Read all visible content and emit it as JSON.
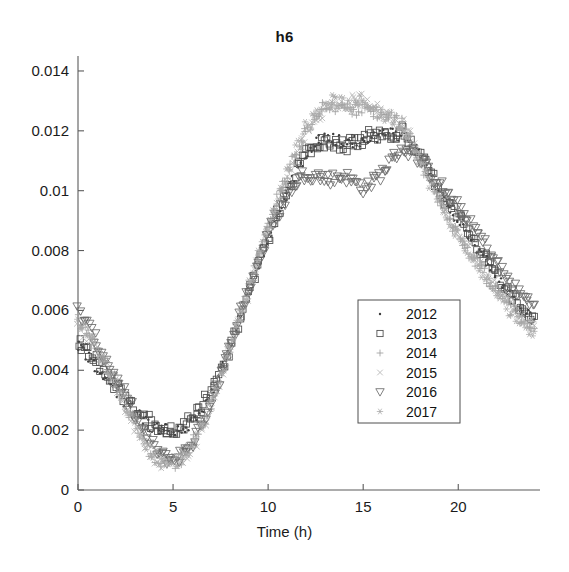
{
  "chart_data": {
    "type": "scatter",
    "title": "h6",
    "xlabel": "Time (h)",
    "ylabel": "",
    "xlim": [
      0,
      24.3
    ],
    "ylim": [
      0,
      0.0145
    ],
    "xticks": [
      0,
      5,
      10,
      15,
      20
    ],
    "xtick_labels": [
      "0",
      "5",
      "10",
      "15",
      "20"
    ],
    "yticks": [
      0,
      0.002,
      0.004,
      0.006,
      0.008,
      0.01,
      0.012,
      0.014
    ],
    "ytick_labels": [
      "0",
      "0.002",
      "0.004",
      "0.006",
      "0.008",
      "0.01",
      "0.012",
      "0.014"
    ],
    "grid": false,
    "legend_position": "center-right",
    "marker_colors": {
      "2012": "#3c3c3c",
      "2013": "#4a4a4a",
      "2014": "#9a9a9a",
      "2015": "#b0b0b0",
      "2016": "#6a6a6a",
      "2017": "#a8a8a8"
    },
    "series": [
      {
        "name": "2012",
        "marker": "point",
        "x": [
          0,
          0.5,
          1,
          1.5,
          2,
          2.5,
          3,
          3.5,
          4,
          4.5,
          5,
          5.5,
          6,
          6.5,
          7,
          7.5,
          8,
          8.5,
          9,
          9.5,
          10,
          10.5,
          11,
          11.5,
          12,
          12.5,
          13,
          13.5,
          14,
          14.5,
          15,
          15.5,
          16,
          16.5,
          17,
          17.5,
          18,
          18.5,
          19,
          19.5,
          20,
          20.5,
          21,
          21.5,
          22,
          22.5,
          23,
          23.5,
          24
        ],
        "values": [
          0.0049,
          0.0045,
          0.0041,
          0.0037,
          0.0033,
          0.0029,
          0.0026,
          0.0023,
          0.0021,
          0.002,
          0.002,
          0.0021,
          0.0023,
          0.0027,
          0.0032,
          0.0039,
          0.0047,
          0.0056,
          0.0065,
          0.0074,
          0.0083,
          0.0091,
          0.0099,
          0.0106,
          0.0112,
          0.0116,
          0.0118,
          0.0117,
          0.0116,
          0.0116,
          0.0117,
          0.0118,
          0.0118,
          0.0119,
          0.0119,
          0.0116,
          0.0111,
          0.0105,
          0.0099,
          0.0094,
          0.009,
          0.0086,
          0.0081,
          0.0076,
          0.0071,
          0.0066,
          0.0062,
          0.0059,
          0.0057
        ]
      },
      {
        "name": "2013",
        "marker": "square",
        "x": [
          0,
          0.5,
          1,
          1.5,
          2,
          2.5,
          3,
          3.5,
          4,
          4.5,
          5,
          5.5,
          6,
          6.5,
          7,
          7.5,
          8,
          8.5,
          9,
          9.5,
          10,
          10.5,
          11,
          11.5,
          12,
          12.5,
          13,
          13.5,
          14,
          14.5,
          15,
          15.5,
          16,
          16.5,
          17,
          17.5,
          18,
          18.5,
          19,
          19.5,
          20,
          20.5,
          21,
          21.5,
          22,
          22.5,
          23,
          23.5,
          24
        ],
        "values": [
          0.005,
          0.0047,
          0.0043,
          0.0039,
          0.0035,
          0.0031,
          0.0027,
          0.0024,
          0.0022,
          0.002,
          0.002,
          0.0021,
          0.0024,
          0.0028,
          0.0033,
          0.004,
          0.0048,
          0.0057,
          0.0066,
          0.0075,
          0.0084,
          0.0092,
          0.01,
          0.0107,
          0.0112,
          0.0115,
          0.0116,
          0.0115,
          0.0115,
          0.0116,
          0.0117,
          0.0119,
          0.0119,
          0.0119,
          0.012,
          0.0117,
          0.0112,
          0.0106,
          0.01,
          0.0095,
          0.0091,
          0.0087,
          0.0082,
          0.0077,
          0.0072,
          0.0067,
          0.0063,
          0.006,
          0.0058
        ]
      },
      {
        "name": "2014",
        "marker": "plus",
        "x": [
          0,
          0.5,
          1,
          1.5,
          2,
          2.5,
          3,
          3.5,
          4,
          4.5,
          5,
          5.5,
          6,
          6.5,
          7,
          7.5,
          8,
          8.5,
          9,
          9.5,
          10,
          10.5,
          11,
          11.5,
          12,
          12.5,
          13,
          13.5,
          14,
          14.5,
          15,
          15.5,
          16,
          16.5,
          17,
          17.5,
          18,
          18.5,
          19,
          19.5,
          20,
          20.5,
          21,
          21.5,
          22,
          22.5,
          23,
          23.5,
          24
        ],
        "values": [
          0.0058,
          0.0053,
          0.0048,
          0.0042,
          0.0036,
          0.0029,
          0.0022,
          0.0015,
          0.0011,
          0.0009,
          0.0009,
          0.0011,
          0.0015,
          0.0021,
          0.0029,
          0.0038,
          0.0048,
          0.0058,
          0.0068,
          0.0078,
          0.0088,
          0.0097,
          0.0105,
          0.0113,
          0.012,
          0.0125,
          0.0128,
          0.0128,
          0.0127,
          0.0127,
          0.0128,
          0.0127,
          0.0125,
          0.0124,
          0.0122,
          0.0117,
          0.011,
          0.0103,
          0.0096,
          0.009,
          0.0085,
          0.008,
          0.0076,
          0.0071,
          0.0067,
          0.0063,
          0.0059,
          0.0056,
          0.0054
        ]
      },
      {
        "name": "2015",
        "marker": "x",
        "x": [
          0,
          0.5,
          1,
          1.5,
          2,
          2.5,
          3,
          3.5,
          4,
          4.5,
          5,
          5.5,
          6,
          6.5,
          7,
          7.5,
          8,
          8.5,
          9,
          9.5,
          10,
          10.5,
          11,
          11.5,
          12,
          12.5,
          13,
          13.5,
          14,
          14.5,
          15,
          15.5,
          16,
          16.5,
          17,
          17.5,
          18,
          18.5,
          19,
          19.5,
          20,
          20.5,
          21,
          21.5,
          22,
          22.5,
          23,
          23.5,
          24
        ],
        "values": [
          0.0056,
          0.0051,
          0.0046,
          0.004,
          0.0034,
          0.0028,
          0.0021,
          0.0015,
          0.0011,
          0.0009,
          0.0009,
          0.0011,
          0.0014,
          0.002,
          0.0028,
          0.0037,
          0.0047,
          0.0057,
          0.0067,
          0.0077,
          0.0087,
          0.0096,
          0.0104,
          0.0112,
          0.0119,
          0.0124,
          0.0127,
          0.0129,
          0.0129,
          0.013,
          0.0131,
          0.0129,
          0.0126,
          0.0125,
          0.0123,
          0.0118,
          0.0111,
          0.0104,
          0.0097,
          0.0091,
          0.0086,
          0.0081,
          0.0077,
          0.0072,
          0.0068,
          0.0064,
          0.006,
          0.0057,
          0.0055
        ]
      },
      {
        "name": "2016",
        "marker": "triangle-down",
        "x": [
          0,
          0.5,
          1,
          1.5,
          2,
          2.5,
          3,
          3.5,
          4,
          4.5,
          5,
          5.5,
          6,
          6.5,
          7,
          7.5,
          8,
          8.5,
          9,
          9.5,
          10,
          10.5,
          11,
          11.5,
          12,
          12.5,
          13,
          13.5,
          14,
          14.5,
          15,
          15.5,
          16,
          16.5,
          17,
          17.5,
          18,
          18.5,
          19,
          19.5,
          20,
          20.5,
          21,
          21.5,
          22,
          22.5,
          23,
          23.5,
          24
        ],
        "values": [
          0.006,
          0.0055,
          0.0049,
          0.0043,
          0.0037,
          0.0031,
          0.0025,
          0.0019,
          0.0014,
          0.0011,
          0.001,
          0.0012,
          0.0016,
          0.0022,
          0.003,
          0.0039,
          0.0048,
          0.0058,
          0.0067,
          0.0076,
          0.0085,
          0.0092,
          0.0098,
          0.0103,
          0.0106,
          0.0105,
          0.0104,
          0.0104,
          0.0105,
          0.0103,
          0.0101,
          0.0103,
          0.0106,
          0.011,
          0.0114,
          0.0113,
          0.011,
          0.0106,
          0.0102,
          0.0098,
          0.0094,
          0.009,
          0.0086,
          0.0081,
          0.0076,
          0.0071,
          0.0067,
          0.0064,
          0.0062
        ]
      },
      {
        "name": "2017",
        "marker": "asterisk",
        "x": [
          0,
          0.5,
          1,
          1.5,
          2,
          2.5,
          3,
          3.5,
          4,
          4.5,
          5,
          5.5,
          6,
          6.5,
          7,
          7.5,
          8,
          8.5,
          9,
          9.5,
          10,
          10.5,
          11,
          11.5,
          12,
          12.5,
          13,
          13.5,
          14,
          14.5,
          15,
          15.5,
          16,
          16.5,
          17,
          17.5,
          18,
          18.5,
          19,
          19.5,
          20,
          20.5,
          21,
          21.5,
          22,
          22.5,
          23,
          23.5,
          24
        ],
        "values": [
          0.0057,
          0.0052,
          0.0047,
          0.0041,
          0.0035,
          0.0029,
          0.0022,
          0.0016,
          0.0012,
          0.0009,
          0.0009,
          0.0011,
          0.0015,
          0.0021,
          0.0029,
          0.0038,
          0.0048,
          0.0058,
          0.0068,
          0.0078,
          0.0088,
          0.0097,
          0.0106,
          0.0114,
          0.0121,
          0.0126,
          0.0129,
          0.013,
          0.0129,
          0.0128,
          0.013,
          0.0128,
          0.0125,
          0.0124,
          0.0122,
          0.0117,
          0.011,
          0.0103,
          0.0096,
          0.009,
          0.0085,
          0.008,
          0.0075,
          0.007,
          0.0066,
          0.0062,
          0.0058,
          0.0055,
          0.0053
        ]
      }
    ],
    "legend": [
      {
        "label": "2012",
        "marker": "point"
      },
      {
        "label": "2013",
        "marker": "square"
      },
      {
        "label": "2014",
        "marker": "plus"
      },
      {
        "label": "2015",
        "marker": "x"
      },
      {
        "label": "2016",
        "marker": "triangle-down"
      },
      {
        "label": "2017",
        "marker": "asterisk"
      }
    ]
  }
}
